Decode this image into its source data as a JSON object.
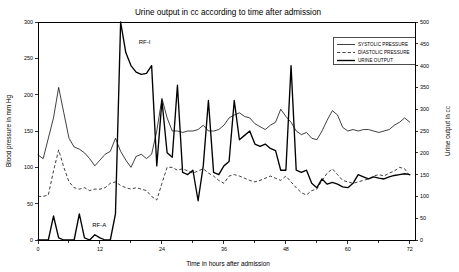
{
  "chart_data": {
    "type": "line",
    "title": "Urine output in cc according to time after admission",
    "xlabel": "Time in hours after admission",
    "ylabel": "Blood pressure in mm Hg",
    "y2label": "Urine output in cc",
    "xlim": [
      0,
      73
    ],
    "ylim": [
      0,
      300
    ],
    "y2lim": [
      0,
      500
    ],
    "xticks": [
      0,
      12,
      24,
      36,
      48,
      60,
      72
    ],
    "xticks_minor": [
      6,
      18,
      30,
      42,
      54,
      66
    ],
    "yticks": [
      0,
      50,
      100,
      150,
      200,
      250,
      300
    ],
    "y2ticks": [
      0,
      50,
      100,
      150,
      200,
      250,
      300,
      350,
      400,
      450,
      500
    ],
    "grid": false,
    "legend_position": "top-right",
    "legend": [
      {
        "name": "SYSTOLIC PRESSURE",
        "style": "solid-thin"
      },
      {
        "name": "DIASTOLIC PRESSURE",
        "style": "dashed"
      },
      {
        "name": "URINE OUTPUT",
        "style": "solid-thick"
      }
    ],
    "annotations": [
      {
        "text": "RF-I",
        "x": 19.5,
        "y": 270,
        "axis": "left"
      },
      {
        "text": "RF-A",
        "x": 10.5,
        "y": 18,
        "axis": "left"
      }
    ],
    "series": [
      {
        "name": "SYSTOLIC PRESSURE",
        "axis": "left",
        "unit": "mm Hg",
        "x": [
          0,
          1,
          2,
          3,
          4,
          5,
          6,
          7,
          8,
          9,
          10,
          11,
          12,
          13,
          14,
          15,
          16,
          17,
          18,
          19,
          20,
          21,
          22,
          23,
          24,
          25,
          26,
          27,
          28,
          29,
          30,
          31,
          32,
          33,
          34,
          35,
          36,
          37,
          38,
          39,
          40,
          41,
          42,
          43,
          44,
          45,
          46,
          47,
          48,
          49,
          50,
          51,
          52,
          53,
          54,
          55,
          56,
          57,
          58,
          59,
          60,
          61,
          62,
          63,
          64,
          65,
          66,
          67,
          68,
          69,
          70,
          71,
          72
        ],
        "values": [
          117,
          112,
          140,
          168,
          210,
          175,
          140,
          128,
          125,
          120,
          112,
          102,
          110,
          118,
          122,
          140,
          122,
          110,
          100,
          115,
          118,
          112,
          118,
          150,
          195,
          168,
          150,
          150,
          148,
          150,
          150,
          152,
          158,
          150,
          150,
          152,
          158,
          168,
          172,
          175,
          170,
          168,
          160,
          156,
          152,
          158,
          162,
          180,
          170,
          162,
          150,
          145,
          148,
          140,
          138,
          150,
          165,
          178,
          172,
          155,
          150,
          152,
          150,
          152,
          152,
          150,
          148,
          150,
          152,
          158,
          162,
          168,
          162
        ]
      },
      {
        "name": "DIASTOLIC PRESSURE",
        "axis": "left",
        "unit": "mm Hg",
        "x": [
          0,
          1,
          2,
          3,
          4,
          5,
          6,
          7,
          8,
          9,
          10,
          11,
          12,
          13,
          14,
          15,
          16,
          17,
          18,
          19,
          20,
          21,
          22,
          23,
          24,
          25,
          26,
          27,
          28,
          29,
          30,
          31,
          32,
          33,
          34,
          35,
          36,
          37,
          38,
          39,
          40,
          41,
          42,
          43,
          44,
          45,
          46,
          47,
          48,
          49,
          50,
          51,
          52,
          53,
          54,
          55,
          56,
          57,
          58,
          59,
          60,
          61,
          62,
          63,
          64,
          65,
          66,
          67,
          68,
          69,
          70,
          71,
          72
        ],
        "values": [
          60,
          60,
          62,
          95,
          124,
          100,
          80,
          72,
          70,
          72,
          68,
          70,
          70,
          72,
          78,
          80,
          75,
          72,
          70,
          72,
          70,
          68,
          60,
          55,
          78,
          100,
          100,
          96,
          98,
          95,
          92,
          95,
          98,
          92,
          88,
          82,
          78,
          88,
          90,
          88,
          85,
          82,
          80,
          82,
          85,
          88,
          85,
          82,
          88,
          80,
          72,
          65,
          62,
          68,
          70,
          82,
          92,
          98,
          90,
          82,
          80,
          78,
          80,
          82,
          84,
          88,
          90,
          88,
          92,
          95,
          100,
          98,
          88
        ]
      },
      {
        "name": "URINE OUTPUT",
        "axis": "right",
        "unit": "cc",
        "x": [
          0,
          1,
          2,
          3,
          4,
          5,
          6,
          7,
          8,
          9,
          10,
          11,
          12,
          13,
          14,
          15,
          16,
          17,
          18,
          19,
          20,
          21,
          22,
          23,
          24,
          25,
          26,
          27,
          28,
          29,
          30,
          31,
          32,
          33,
          34,
          35,
          36,
          37,
          38,
          39,
          40,
          41,
          42,
          43,
          44,
          45,
          46,
          47,
          48,
          49,
          50,
          51,
          52,
          53,
          54,
          55,
          56,
          57,
          58,
          59,
          60,
          61,
          62,
          63,
          64,
          65,
          66,
          67,
          68,
          69,
          70,
          71,
          72
        ],
        "values": [
          0,
          0,
          0,
          55,
          5,
          0,
          0,
          0,
          60,
          5,
          0,
          12,
          5,
          0,
          0,
          60,
          500,
          430,
          400,
          385,
          380,
          382,
          400,
          170,
          320,
          200,
          190,
          355,
          155,
          150,
          160,
          90,
          170,
          320,
          155,
          150,
          170,
          180,
          320,
          230,
          240,
          250,
          220,
          215,
          220,
          210,
          205,
          160,
          160,
          400,
          160,
          155,
          160,
          130,
          120,
          140,
          128,
          132,
          128,
          122,
          120,
          130,
          150,
          145,
          140,
          145,
          142,
          140,
          145,
          148,
          150,
          152,
          150
        ]
      }
    ]
  }
}
